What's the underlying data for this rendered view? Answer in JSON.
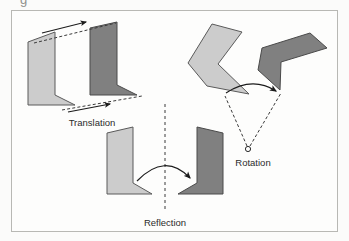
{
  "figure": {
    "background_color": "#fbfbfa",
    "panel_color": "#fdfdfc",
    "border_color": "#b8b8b4",
    "partial_glyph_top": "g"
  },
  "palette": {
    "light_shape_fill": "#cccccc",
    "light_shape_stroke": "#5a5a5a",
    "dark_shape_fill": "#808080",
    "dark_shape_stroke": "#4a4a4a",
    "arrow_color": "#1c1c1c",
    "dashed_color": "#3a3a3a",
    "label_color": "#2b2b2b"
  },
  "labels": {
    "translation": "Translation",
    "rotation": "Rotation",
    "reflection": "Reflection"
  },
  "chart_data": {
    "type": "diagram",
    "title": "",
    "transformations": [
      {
        "name": "Translation",
        "label": "Translation",
        "label_position": {
          "x": 92,
          "y": 123
        },
        "description": "A light gray chevron slides along a fixed vector to a dark gray image; two parallel dashed vectors with solid arrowheads mark equal displacement of corresponding vertices.",
        "preimage": {
          "fill": "#cccccc",
          "points": "28,42 55,32 55,95 75,105 28,105"
        },
        "image": {
          "fill": "#808080",
          "points": "90,28 117,22 117,85 137,95 90,95"
        },
        "vectors": [
          {
            "name": "upper-translation-vector",
            "from": {
              "x": 38,
              "y": 40
            },
            "to": {
              "x": 112,
              "y": 25
            },
            "style": "dashed-with-solid-arrow"
          },
          {
            "name": "lower-translation-vector",
            "from": {
              "x": 68,
              "y": 108
            },
            "to": {
              "x": 140,
              "y": 98
            },
            "style": "dashed-with-solid-arrow"
          }
        ]
      },
      {
        "name": "Rotation",
        "label": "Rotation",
        "label_position": {
          "x": 253,
          "y": 163
        },
        "description": "A light gray chevron turns about a center point marked by a small open circle; dashed radii connect the center to corresponding vertices and a curved solid arrow shows the turning direction.",
        "preimage": {
          "fill": "#cccccc",
          "points": "212,24 242,32 218,64 249,94 207,86 188,63"
        },
        "image": {
          "fill": "#808080",
          "points": "262,48 310,33 327,48 281,62 280,90 258,70"
        },
        "center_of_rotation": {
          "name": "center-of-rotation-marker",
          "x": 248,
          "y": 149,
          "radius": 2.6,
          "style": "open-circle"
        },
        "radii": [
          {
            "from": {
              "x": 248,
              "y": 149
            },
            "to": {
              "x": 224,
              "y": 95
            }
          },
          {
            "from": {
              "x": 248,
              "y": 149
            },
            "to": {
              "x": 281,
              "y": 93
            }
          }
        ],
        "arc_arrow": {
          "name": "rotation-arc-arrow",
          "start": {
            "x": 225,
            "y": 90
          },
          "end": {
            "x": 278,
            "y": 90
          },
          "sweep": "clockwise"
        }
      },
      {
        "name": "Reflection",
        "label": "Reflection",
        "label_position": {
          "x": 165,
          "y": 223
        },
        "description": "A light gray chevron is mirrored across a vertical dashed line of reflection to a dark gray image; a curved solid arrow crosses the mirror line.",
        "preimage": {
          "fill": "#cccccc",
          "points": "107,133 133,127 133,183 152,194 107,194"
        },
        "image": {
          "fill": "#808080",
          "points": "223,133 197,127 197,183 178,194 223,194"
        },
        "mirror_line": {
          "name": "line-of-reflection",
          "x": 165,
          "y_top": 104,
          "y_bottom": 212,
          "style": "dashed-vertical"
        },
        "arc_arrow": {
          "name": "reflection-arc-arrow",
          "start": {
            "x": 137,
            "y": 180
          },
          "end": {
            "x": 192,
            "y": 180
          },
          "sweep": "clockwise"
        }
      }
    ]
  }
}
